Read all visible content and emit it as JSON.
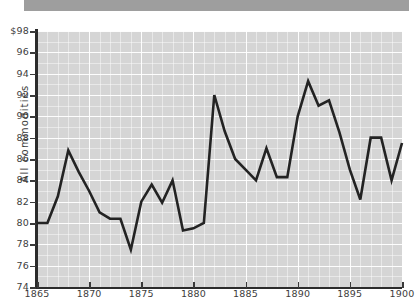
{
  "chart_data": {
    "type": "line",
    "title": "",
    "xlabel": "",
    "ylabel": "All commodities",
    "xlim": [
      1865,
      1900
    ],
    "ylim": [
      74,
      98
    ],
    "grid": true,
    "legend": "none",
    "y_tick_labels": [
      "$98",
      "96",
      "94",
      "92",
      "90",
      "88",
      "86",
      "84",
      "82",
      "80",
      "78",
      "76",
      "74"
    ],
    "y_ticks": [
      98,
      96,
      94,
      92,
      90,
      88,
      86,
      84,
      82,
      80,
      78,
      76,
      74
    ],
    "x_tick_labels": [
      "1865",
      "1870",
      "1875",
      "1880",
      "1885",
      "1890",
      "1895",
      "1900"
    ],
    "x_ticks": [
      1865,
      1870,
      1875,
      1880,
      1885,
      1890,
      1895,
      1900
    ],
    "x": [
      1865,
      1866,
      1867,
      1868,
      1869,
      1870,
      1871,
      1872,
      1873,
      1874,
      1875,
      1876,
      1877,
      1878,
      1879,
      1880,
      1881,
      1882,
      1883,
      1884,
      1885,
      1886,
      1887,
      1888,
      1889,
      1890,
      1891,
      1892,
      1893,
      1894,
      1895,
      1896,
      1897,
      1898,
      1899,
      1900
    ],
    "series": [
      {
        "name": "All commodities",
        "values": [
          80.0,
          80.0,
          82.5,
          86.8,
          84.8,
          83.0,
          81.0,
          80.4,
          80.4,
          77.5,
          82.0,
          83.6,
          81.9,
          84.0,
          79.3,
          79.5,
          80.0,
          92.0,
          88.6,
          86.0,
          85.0,
          84.0,
          87.0,
          84.3,
          84.3,
          90.0,
          93.3,
          91.0,
          91.5,
          88.5,
          85.0,
          82.2,
          88.0,
          88.0,
          84.0,
          87.5
        ]
      }
    ]
  },
  "axes": {
    "y_axis_name": "y-axis",
    "x_axis_name": "x-axis"
  },
  "colors": {
    "plot_background": "#d5d5d5",
    "gridline": "#ffffff",
    "series_line": "#232323",
    "axis": "#2b2b2b",
    "tick_label": "#3d3d3d",
    "top_bar": "#9e9e9e",
    "page_background": "#ffffff"
  }
}
